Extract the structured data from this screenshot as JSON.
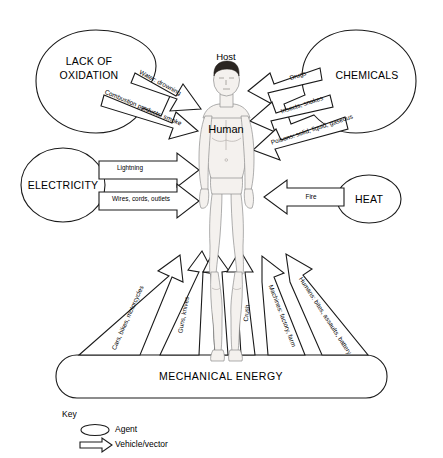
{
  "diagram": {
    "host": {
      "caption": "Host",
      "body_label": "Human"
    },
    "agents": [
      {
        "id": "lack-of-oxidation",
        "label": "LACK OF OXIDATION",
        "shape": "cloud",
        "vectors": [
          {
            "id": "water-drowning",
            "label": "Water: drowning"
          },
          {
            "id": "combustion-products-smoke",
            "label": "Combustion products: smoke"
          }
        ]
      },
      {
        "id": "chemicals",
        "label": "CHEMICALS",
        "shape": "cloud",
        "vectors": [
          {
            "id": "drugs",
            "label": "Drugs"
          },
          {
            "id": "insects-snakes",
            "label": "Insects, snakes"
          },
          {
            "id": "poisons",
            "label": "Poisons: solid, liquid, gaseous"
          }
        ]
      },
      {
        "id": "electricity",
        "label": "ELECTRICITY",
        "shape": "circle",
        "vectors": [
          {
            "id": "lightning",
            "label": "Lightning"
          },
          {
            "id": "wires-cords-outlets",
            "label": "Wires, cords, outlets"
          }
        ]
      },
      {
        "id": "heat",
        "label": "HEAT",
        "shape": "circle",
        "vectors": [
          {
            "id": "fire",
            "label": "Fire"
          }
        ]
      },
      {
        "id": "mechanical-energy",
        "label": "MECHANICAL ENERGY",
        "shape": "rounded-rect",
        "vectors": [
          {
            "id": "cars-bikes-motorcycles",
            "label": "Cars, bikes, motorcycles"
          },
          {
            "id": "guns-knives",
            "label": "Guns, knives"
          },
          {
            "id": "falls",
            "label": "Falls"
          },
          {
            "id": "crush",
            "label": "Crush"
          },
          {
            "id": "machines-factory-farm",
            "label": "Machines: factory, farm"
          },
          {
            "id": "humans-bites-assaults-battery",
            "label": "Humans: bites, assaults, battery"
          }
        ]
      }
    ],
    "key": {
      "title": "Key",
      "items": [
        {
          "id": "agent",
          "label": "Agent",
          "symbol": "ellipse-icon"
        },
        {
          "id": "vehicle-vector",
          "label": "Vehicle/vector",
          "symbol": "arrow-icon"
        }
      ]
    },
    "colors": {
      "background": "#ffffff",
      "stroke": "#1a1a1a",
      "text": "#000000",
      "skin": "#f4f1ee",
      "hair": "#2b2622"
    }
  }
}
